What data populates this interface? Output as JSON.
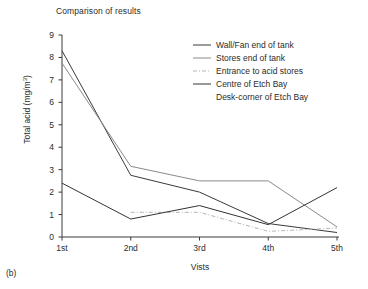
{
  "figure": {
    "panel_caption": "(b)",
    "title": "Comparison of results"
  },
  "chart_data": {
    "type": "line",
    "title": "Comparison of results",
    "xlabel": "Vists",
    "ylabel": "Total acid (mg/m3)",
    "ylabel_display": "Total acid (mg/m",
    "ylabel_exponent": "3",
    "ylabel_close": ")",
    "categories": [
      "1st",
      "2nd",
      "3rd",
      "4th",
      "5th"
    ],
    "x_tick_labels": [
      "1st",
      "2nd",
      "3rd",
      "4th",
      "5th"
    ],
    "y_tick_labels": [
      "0",
      "1",
      "2",
      "3",
      "4",
      "5",
      "6",
      "7",
      "8",
      "9"
    ],
    "ylim": [
      0,
      9
    ],
    "xlim": [
      0.5,
      5.5
    ],
    "grid": false,
    "legend_position": "upper-right-inside",
    "series": [
      {
        "name": "Wall/Fan end of tank",
        "values": [
          8.3,
          2.75,
          2.0,
          0.6,
          0.2
        ],
        "color": "#3a3a3a",
        "style": "solid",
        "width": 1.0,
        "legend_swatch": "line-solid-dark"
      },
      {
        "name": "Stores end of tank",
        "values": [
          7.75,
          3.15,
          2.5,
          2.5,
          0.45
        ],
        "color": "#8a8a8a",
        "style": "solid",
        "width": 1.0,
        "legend_swatch": "line-solid-grey"
      },
      {
        "name": "Entrance to acid stores",
        "values": [
          null,
          1.1,
          1.1,
          0.25,
          0.4
        ],
        "color": "#b5b5b5",
        "style": "dashdot",
        "width": 1.0,
        "legend_swatch": "line-dashdot-light"
      },
      {
        "name": "Centre of Etch Bay",
        "values": [
          2.4,
          0.8,
          1.4,
          0.55,
          2.2
        ],
        "color": "#333333",
        "style": "solid",
        "width": 1.0,
        "legend_swatch": "line-solid-dark"
      },
      {
        "name": "Desk-corner of Etch Bay",
        "values": [
          null,
          null,
          null,
          null,
          null
        ],
        "color": "#555555",
        "style": "none",
        "width": 0,
        "legend_swatch": "none"
      }
    ],
    "annotations": []
  }
}
